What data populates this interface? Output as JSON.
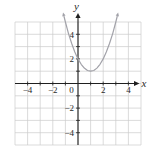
{
  "chart_data": {
    "type": "line",
    "title": "",
    "xlabel": "x",
    "ylabel": "y",
    "xlim": [
      -5,
      5
    ],
    "ylim": [
      -5,
      5
    ],
    "grid": true,
    "x_ticks": {
      "values": [
        -4,
        -2,
        0,
        2,
        4
      ],
      "labels": [
        "−4",
        "−2",
        "0",
        "2",
        "4"
      ]
    },
    "y_ticks": {
      "values": [
        4,
        2,
        -2,
        -4
      ],
      "labels": [
        "4",
        "2",
        "−2",
        "−4"
      ]
    },
    "series": [
      {
        "name": "parabola",
        "equation": "y = (x - 1)^2 + 1",
        "vertex": [
          1,
          1
        ],
        "arrows": "both-ends",
        "points": [
          [
            -1.12,
            5.49
          ],
          [
            -1,
            5
          ],
          [
            -0.75,
            4.06
          ],
          [
            -0.5,
            3.25
          ],
          [
            -0.25,
            2.56
          ],
          [
            0,
            2
          ],
          [
            0.25,
            1.56
          ],
          [
            0.5,
            1.25
          ],
          [
            0.75,
            1.06
          ],
          [
            1,
            1
          ],
          [
            1.25,
            1.06
          ],
          [
            1.5,
            1.25
          ],
          [
            1.75,
            1.56
          ],
          [
            2,
            2
          ],
          [
            2.25,
            2.56
          ],
          [
            2.5,
            3.25
          ],
          [
            2.75,
            4.06
          ],
          [
            3,
            5
          ],
          [
            3.12,
            5.49
          ]
        ]
      }
    ],
    "colors": {
      "curve": "#a2a2a9",
      "axis": "#1f1f1f",
      "grid": "#cccccc",
      "text": "#2a2a2a",
      "background": "#ffffff"
    }
  }
}
